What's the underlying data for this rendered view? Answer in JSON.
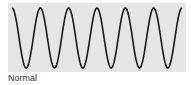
{
  "figure": {
    "caption": "Normal",
    "panel_color": "#e6e6e6",
    "wave_color": "#1a1a1a",
    "wave": {
      "type": "sine",
      "cycles": 6,
      "x_start": 12,
      "x_end": 182,
      "y_top": 8,
      "y_bottom": 68
    }
  }
}
